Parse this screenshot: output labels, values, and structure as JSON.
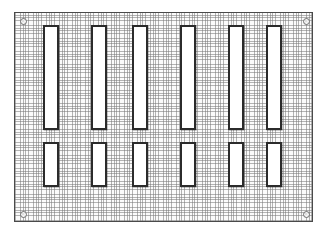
{
  "drawing": {
    "title": "Perforated slotted plate",
    "figure_label": "",
    "canvas": {
      "width": 327,
      "height": 236,
      "background_color": "#ffffff"
    },
    "plate": {
      "name": "slotted-plate",
      "x": 14,
      "y": 12,
      "width": 299,
      "height": 210,
      "fill_color": "#fbfbfb",
      "hatch_color": "#787878",
      "border_color": "#4a4a4a",
      "border_width": 1.5
    },
    "slot_style": {
      "fill_color": "#ffffff",
      "outline_color": "#2b2b2b",
      "outline_width": 2
    },
    "hole_style": {
      "fill_color": "#f2f2f2",
      "outline_color": "#6d6d6d",
      "diameter": 7
    },
    "rows": [
      {
        "name": "upper-slot-row",
        "count": 6,
        "y": 24,
        "height": 105,
        "slot_width": 16,
        "x_positions": [
          42,
          90,
          131,
          179,
          227,
          265
        ]
      },
      {
        "name": "lower-slot-row",
        "count": 6,
        "y": 141,
        "height": 45,
        "slot_width": 16,
        "x_positions": [
          42,
          90,
          131,
          179,
          227,
          265
        ]
      }
    ],
    "holes": [
      {
        "name": "corner-hole-top-left",
        "cx": 22,
        "cy": 20
      },
      {
        "name": "corner-hole-top-right",
        "cx": 305,
        "cy": 20
      },
      {
        "name": "corner-hole-bottom-left",
        "cx": 22,
        "cy": 213
      },
      {
        "name": "corner-hole-bottom-right",
        "cx": 305,
        "cy": 213
      }
    ]
  }
}
